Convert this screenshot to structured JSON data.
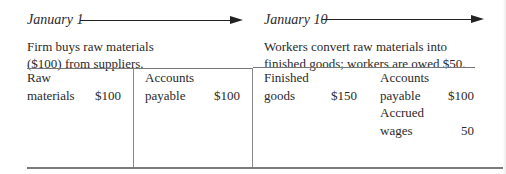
{
  "left": {
    "date": "January 1",
    "description_lines": [
      "Firm buys raw materials",
      "($100) from suppliers."
    ],
    "assets": [
      {
        "label_lines": [
          "Raw",
          "materials"
        ],
        "amount": "$100"
      }
    ],
    "liabilities": [
      {
        "label_lines": [
          "Accounts",
          "payable"
        ],
        "amount": "$100"
      }
    ]
  },
  "right": {
    "date": "January 10",
    "description_lines": [
      "Workers convert raw materials into",
      "finished goods; workers are owed $50."
    ],
    "assets": [
      {
        "label_lines": [
          "Finished",
          "goods"
        ],
        "amount": "$150"
      }
    ],
    "liabilities": [
      {
        "label_lines": [
          "Accounts",
          "payable"
        ],
        "amount": "$100"
      },
      {
        "label_lines": [
          "Accrued",
          "wages"
        ],
        "amount": "50"
      }
    ]
  }
}
